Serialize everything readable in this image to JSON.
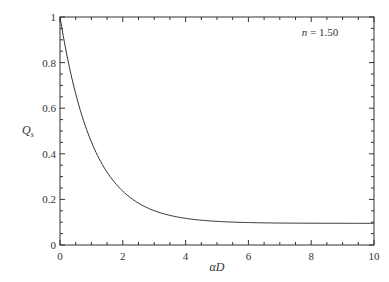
{
  "chart_data": {
    "type": "line",
    "title": "",
    "xlabel": "αD",
    "ylabel": "Q",
    "ylabel_subscript": "s",
    "xlim": [
      0,
      10
    ],
    "ylim": [
      0,
      1
    ],
    "x_ticks": [
      0,
      2,
      4,
      6,
      8,
      10
    ],
    "y_ticks": [
      0,
      0.2,
      0.4,
      0.6,
      0.8,
      1
    ],
    "x_tick_labels": [
      "0",
      "2",
      "4",
      "6",
      "8",
      "10"
    ],
    "y_tick_labels": [
      "0",
      "0.2",
      "0.4",
      "0.6",
      "0.8",
      "1"
    ],
    "grid": false,
    "annotation": {
      "var": "n",
      "text": " = 1.50"
    },
    "series": [
      {
        "name": "Q_s (n = 1.50)",
        "color": "#333333",
        "x": [
          0,
          0.25,
          0.5,
          0.75,
          1,
          1.25,
          1.5,
          2,
          2.5,
          3,
          3.5,
          4,
          5,
          6,
          7,
          8,
          9,
          10
        ],
        "y": [
          1.0,
          0.8,
          0.66,
          0.54,
          0.46,
          0.38,
          0.32,
          0.235,
          0.184,
          0.15,
          0.13,
          0.118,
          0.104,
          0.099,
          0.097,
          0.096,
          0.095,
          0.095
        ]
      }
    ]
  }
}
